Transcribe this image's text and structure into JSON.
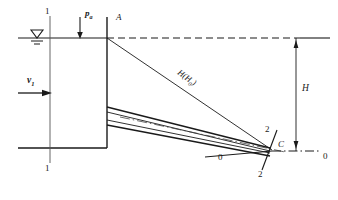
{
  "figure": {
    "colors": {
      "line": "#1a1a1a",
      "background": "#ffffff",
      "thin_line": "#333333"
    },
    "labels": {
      "section_1_top": "1",
      "section_1_bottom": "1",
      "atmospheric_pressure": "p",
      "atmospheric_pressure_sub": "a",
      "point_a": "A",
      "velocity_1": "v",
      "velocity_1_sub": "1",
      "head": "H(H",
      "head_sub": "0",
      "head_close": ")",
      "section_2_top": "2",
      "section_2_bottom": "2",
      "point_c": "C",
      "datum_left": "0",
      "datum_right": "0",
      "height_h": "H"
    },
    "elements": {
      "free_surface_symbol": "water-level-triangle",
      "pressure_arrow": "downward-arrow",
      "velocity_arrow": "rightward-arrow",
      "dimension_arrows": "double-headed-vertical",
      "centerline_style": "dash-dot",
      "water_level_extension": "dashed"
    }
  }
}
